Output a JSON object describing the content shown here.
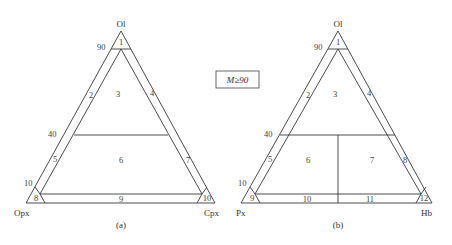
{
  "legend": {
    "condition": "M≥90"
  },
  "diagram_a": {
    "caption": "(a)",
    "vertices": {
      "top": "Ol",
      "bottom_left": "Opx",
      "bottom_right": "Cpx"
    },
    "ticks": [
      "90",
      "40",
      "10"
    ],
    "fields": [
      "1",
      "2",
      "3",
      "4",
      "5",
      "6",
      "7",
      "8",
      "9",
      "10"
    ]
  },
  "diagram_b": {
    "caption": "(b)",
    "vertices": {
      "top": "Ol",
      "bottom_left": "Px",
      "bottom_right": "Hb"
    },
    "ticks": [
      "90",
      "40",
      "10"
    ],
    "fields": [
      "1",
      "2",
      "3",
      "4",
      "5",
      "6",
      "7",
      "8",
      "9",
      "10",
      "11",
      "12"
    ]
  }
}
